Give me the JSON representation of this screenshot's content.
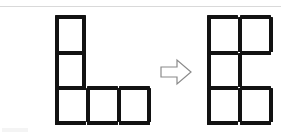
{
  "diagram": {
    "background_color": "#ffffff",
    "stick_color": "#121212",
    "rule_color": "#d9d9d9",
    "arrow_outline_color": "#8a8a8a",
    "arrow_fill_color": "#ffffff"
  },
  "left_figure": {
    "name": "L-shape",
    "label": "L",
    "cell_count": 3,
    "stick_count": 12,
    "description": "Two squares stacked vertically at left plus two more squares extending right along the bottom row, forming an L",
    "sticks": [
      {
        "id": "L-h1",
        "orientation": "horizontal",
        "x": 55,
        "y": 15,
        "length": 31
      },
      {
        "id": "L-v1",
        "orientation": "vertical",
        "x": 55,
        "y": 17,
        "length": 35
      },
      {
        "id": "L-v2",
        "orientation": "vertical",
        "x": 82,
        "y": 17,
        "length": 35
      },
      {
        "id": "L-h2",
        "orientation": "horizontal",
        "x": 55,
        "y": 51,
        "length": 31
      },
      {
        "id": "L-v3",
        "orientation": "vertical",
        "x": 55,
        "y": 53,
        "length": 34
      },
      {
        "id": "L-v4",
        "orientation": "vertical",
        "x": 82,
        "y": 53,
        "length": 34
      },
      {
        "id": "L-h3",
        "orientation": "horizontal",
        "x": 55,
        "y": 86,
        "length": 31
      },
      {
        "id": "L-h4",
        "orientation": "horizontal",
        "x": 87,
        "y": 86,
        "length": 31
      },
      {
        "id": "L-h5",
        "orientation": "horizontal",
        "x": 119,
        "y": 86,
        "length": 31
      },
      {
        "id": "L-v5",
        "orientation": "vertical",
        "x": 55,
        "y": 88,
        "length": 34
      },
      {
        "id": "L-v6",
        "orientation": "vertical",
        "x": 86,
        "y": 88,
        "length": 34
      },
      {
        "id": "L-v7",
        "orientation": "vertical",
        "x": 117,
        "y": 88,
        "length": 34
      },
      {
        "id": "L-v8",
        "orientation": "vertical",
        "x": 147,
        "y": 88,
        "length": 34
      },
      {
        "id": "L-h6",
        "orientation": "horizontal",
        "x": 55,
        "y": 121,
        "length": 31
      },
      {
        "id": "L-h7",
        "orientation": "horizontal",
        "x": 87,
        "y": 121,
        "length": 31
      },
      {
        "id": "L-h8",
        "orientation": "horizontal",
        "x": 119,
        "y": 121,
        "length": 31
      }
    ]
  },
  "arrow": {
    "name": "transformation-arrow",
    "direction": "right",
    "x": 160,
    "y": 58,
    "width": 32,
    "height": 28
  },
  "right_figure": {
    "name": "E-shape",
    "label": "E",
    "cell_count": 4,
    "description": "Two squares on the top row, two squares on the bottom row, and an open middle row missing its right vertical, forming an E",
    "sticks": [
      {
        "id": "R-h1",
        "orientation": "horizontal",
        "x": 207,
        "y": 15,
        "length": 31
      },
      {
        "id": "R-h2",
        "orientation": "horizontal",
        "x": 240,
        "y": 15,
        "length": 31
      },
      {
        "id": "R-v1",
        "orientation": "vertical",
        "x": 207,
        "y": 17,
        "length": 35
      },
      {
        "id": "R-v2",
        "orientation": "vertical",
        "x": 238,
        "y": 17,
        "length": 35
      },
      {
        "id": "R-v3",
        "orientation": "vertical",
        "x": 269,
        "y": 17,
        "length": 35
      },
      {
        "id": "R-h3",
        "orientation": "horizontal",
        "x": 207,
        "y": 51,
        "length": 31
      },
      {
        "id": "R-h4",
        "orientation": "horizontal",
        "x": 240,
        "y": 51,
        "length": 31
      },
      {
        "id": "R-v4",
        "orientation": "vertical",
        "x": 207,
        "y": 53,
        "length": 34
      },
      {
        "id": "R-v5",
        "orientation": "vertical",
        "x": 238,
        "y": 53,
        "length": 34
      },
      {
        "id": "R-h5",
        "orientation": "horizontal",
        "x": 207,
        "y": 86,
        "length": 31
      },
      {
        "id": "R-h6",
        "orientation": "horizontal",
        "x": 240,
        "y": 86,
        "length": 31
      },
      {
        "id": "R-v6",
        "orientation": "vertical",
        "x": 207,
        "y": 88,
        "length": 34
      },
      {
        "id": "R-v7",
        "orientation": "vertical",
        "x": 238,
        "y": 88,
        "length": 34
      },
      {
        "id": "R-v8",
        "orientation": "vertical",
        "x": 269,
        "y": 88,
        "length": 34
      },
      {
        "id": "R-h7",
        "orientation": "horizontal",
        "x": 207,
        "y": 121,
        "length": 31
      },
      {
        "id": "R-h8",
        "orientation": "horizontal",
        "x": 240,
        "y": 121,
        "length": 31
      }
    ]
  }
}
